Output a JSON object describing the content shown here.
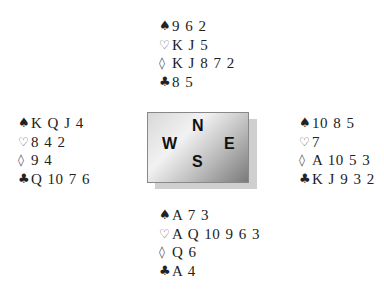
{
  "suits": {
    "spades": "♠",
    "hearts": "♡",
    "diamonds": "◊",
    "clubs": "♣"
  },
  "compass": {
    "north": "N",
    "south": "S",
    "east": "E",
    "west": "W"
  },
  "hands": {
    "north": {
      "spades": "9 6 2",
      "hearts": "K J 5",
      "diamonds": "K J 8 7 2",
      "clubs": "8 5"
    },
    "west": {
      "spades": "K Q J 4",
      "hearts": "8 4 2",
      "diamonds": "9 4",
      "clubs": "Q 10 7 6"
    },
    "east": {
      "spades": "10 8 5",
      "hearts": "7",
      "diamonds": "A 10 5 3",
      "clubs": "K J 9 3 2"
    },
    "south": {
      "spades": "A 7 3",
      "hearts": "A Q 10 9 6 3",
      "diamonds": "Q 6",
      "clubs": "A 4"
    }
  }
}
